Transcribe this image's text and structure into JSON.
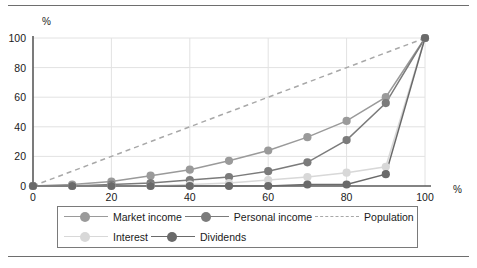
{
  "chart_data": {
    "type": "line",
    "title": "",
    "subtitle": "",
    "xlabel": "%",
    "ylabel": "%",
    "xlim": [
      0,
      100
    ],
    "ylim": [
      0,
      100
    ],
    "x_ticks": [
      0,
      20,
      40,
      60,
      80,
      100
    ],
    "y_ticks": [
      0,
      20,
      40,
      60,
      80,
      100
    ],
    "grid": true,
    "legend_position": "bottom",
    "x": [
      0,
      10,
      20,
      30,
      40,
      50,
      60,
      70,
      80,
      90,
      100
    ],
    "series": [
      {
        "name": "Market income",
        "color": "#9a9a9a",
        "style": "solid",
        "marker": "circle",
        "values": [
          0,
          1,
          3,
          7,
          11,
          17,
          24,
          33,
          44,
          60,
          100
        ]
      },
      {
        "name": "Personal income",
        "color": "#7b7b7b",
        "style": "solid",
        "marker": "circle",
        "values": [
          0,
          0,
          1,
          2,
          4,
          6,
          10,
          16,
          31,
          56,
          100
        ]
      },
      {
        "name": "Population",
        "color": "#a8a8a8",
        "style": "dashed",
        "marker": "none",
        "values": [
          0,
          10,
          20,
          30,
          40,
          50,
          60,
          70,
          80,
          90,
          100
        ]
      },
      {
        "name": "Interest",
        "color": "#d8d8d8",
        "style": "solid",
        "marker": "circle",
        "values": [
          0,
          0,
          0,
          0,
          1,
          2,
          4,
          6,
          9,
          13,
          100
        ]
      },
      {
        "name": "Dividends",
        "color": "#6a6a6a",
        "style": "solid",
        "marker": "circle",
        "values": [
          0,
          0,
          0,
          0,
          0,
          0,
          0,
          1,
          1,
          8,
          100
        ]
      }
    ]
  },
  "axes": {
    "y_axis_unit_label": "%",
    "x_axis_unit_label": "%",
    "y_tick_labels": [
      "100",
      "80",
      "60",
      "40",
      "20",
      "0"
    ],
    "x_tick_labels": [
      "0",
      "20",
      "40",
      "60",
      "80",
      "100"
    ]
  },
  "legend": {
    "rows": [
      [
        {
          "label": "Market income",
          "color": "#9a9a9a",
          "style": "solid",
          "marker": true
        },
        {
          "label": "Personal income",
          "color": "#7b7b7b",
          "style": "solid",
          "marker": true
        },
        {
          "label": "Population",
          "color": "#a8a8a8",
          "style": "dashed",
          "marker": false
        }
      ],
      [
        {
          "label": "Interest",
          "color": "#d8d8d8",
          "style": "solid",
          "marker": true
        },
        {
          "label": "Dividends",
          "color": "#6a6a6a",
          "style": "solid",
          "marker": true
        }
      ]
    ]
  },
  "colors": {
    "frame": "#6e6e6e",
    "axis": "#5a5a5a",
    "grid": "#e2e2e2",
    "legend_border": "#7a7a7a",
    "text": "#1a1a1a",
    "background": "#ffffff"
  }
}
